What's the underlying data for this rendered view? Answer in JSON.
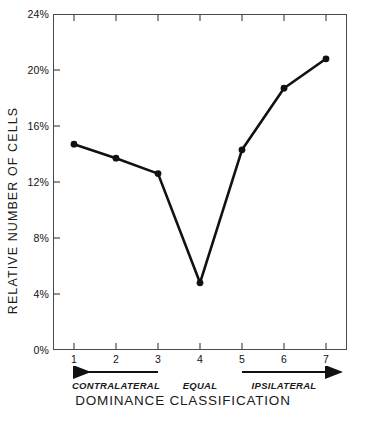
{
  "chart_data": {
    "type": "line",
    "title": "",
    "xlabel": "DOMINANCE CLASSIFICATION",
    "ylabel": "RELATIVE NUMBER OF CELLS",
    "categories": [
      "1",
      "2",
      "3",
      "4",
      "5",
      "6",
      "7"
    ],
    "values": [
      14.7,
      13.7,
      12.6,
      4.8,
      14.3,
      18.7,
      20.8
    ],
    "ylim": [
      0,
      24
    ],
    "ytick_values": [
      0,
      4,
      8,
      12,
      16,
      20,
      24
    ],
    "ytick_labels": [
      "0%",
      "4%",
      "8%",
      "12%",
      "16%",
      "20%",
      "24%"
    ],
    "xlim": [
      0.5,
      7.5
    ],
    "grid": false,
    "legend": "none",
    "marker": "filled-circle",
    "line_color": "#111111",
    "marker_color": "#111111",
    "axis_color": "#4a4a4a",
    "annotations": [
      {
        "label": "CONTRALATERAL",
        "arrow": "left",
        "from_category": "3",
        "to_category": "1"
      },
      {
        "label": "EQUAL",
        "arrow": "none",
        "from_category": "4",
        "to_category": "4"
      },
      {
        "label": "IPSILATERAL",
        "arrow": "right",
        "from_category": "5",
        "to_category": "7"
      }
    ]
  }
}
